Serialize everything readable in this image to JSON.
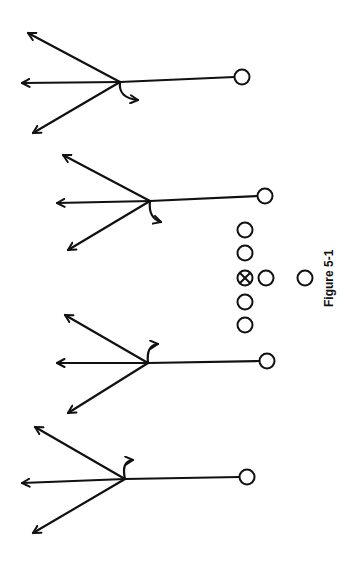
{
  "figure": {
    "caption": "Figure 5-1",
    "orientation": "rotated -90deg (page turned sideways)",
    "line_color": "#111111",
    "background": "#ffffff"
  },
  "formation": {
    "offensive_line": [
      {
        "id": "ol1",
        "x": 245,
        "y": 230
      },
      {
        "id": "ol2",
        "x": 245,
        "y": 253
      },
      {
        "id": "center",
        "x": 245,
        "y": 278,
        "marked": true
      },
      {
        "id": "ol4",
        "x": 245,
        "y": 302
      },
      {
        "id": "ol5",
        "x": 245,
        "y": 325
      }
    ],
    "backs": [
      {
        "id": "qb",
        "x": 266,
        "y": 278
      },
      {
        "id": "rb",
        "x": 305,
        "y": 278
      }
    ]
  },
  "receivers": [
    {
      "id": "receiver-1",
      "start": [
        242,
        77
      ],
      "branch": [
        120,
        82
      ],
      "routes": {
        "upper": [
          28,
          33
        ],
        "straight": [
          22,
          83
        ],
        "lower": [
          33,
          133
        ]
      },
      "hook": {
        "ctrl": [
          118,
          98
        ],
        "end": [
          138,
          100
        ],
        "direction": "down"
      }
    },
    {
      "id": "receiver-2",
      "start": [
        265,
        196
      ],
      "branch": [
        150,
        201
      ],
      "routes": {
        "upper": [
          63,
          155
        ],
        "straight": [
          57,
          203
        ],
        "lower": [
          68,
          250
        ]
      },
      "hook": {
        "ctrl": [
          148,
          218
        ],
        "end": [
          161,
          222
        ],
        "direction": "down"
      }
    },
    {
      "id": "receiver-3",
      "start": [
        267,
        361
      ],
      "branch": [
        148,
        363
      ],
      "routes": {
        "upper": [
          65,
          315
        ],
        "straight": [
          57,
          363
        ],
        "lower": [
          68,
          413
        ]
      },
      "hook": {
        "ctrl": [
          146,
          345
        ],
        "end": [
          158,
          344
        ],
        "direction": "up"
      }
    },
    {
      "id": "receiver-4",
      "start": [
        247,
        477
      ],
      "branch": [
        125,
        479
      ],
      "routes": {
        "upper": [
          35,
          427
        ],
        "straight": [
          22,
          483
        ],
        "lower": [
          33,
          533
        ]
      },
      "hook": {
        "ctrl": [
          121,
          461
        ],
        "end": [
          133,
          460
        ],
        "direction": "up"
      }
    }
  ]
}
